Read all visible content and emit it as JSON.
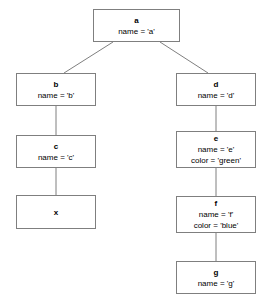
{
  "diagram": {
    "type": "tree",
    "title": "",
    "background_color": "#ffffff",
    "border_color": "#7f7f7f",
    "text_color": "#000000",
    "nodes": [
      {
        "id": "a",
        "title": "a",
        "attrs": [
          "name = 'a'"
        ],
        "x": 93,
        "y": 9,
        "w": 87,
        "h": 33
      },
      {
        "id": "b",
        "title": "b",
        "attrs": [
          "name = 'b'"
        ],
        "x": 16,
        "y": 73,
        "w": 80,
        "h": 33
      },
      {
        "id": "d",
        "title": "d",
        "attrs": [
          "name = 'd'"
        ],
        "x": 176,
        "y": 73,
        "w": 80,
        "h": 33
      },
      {
        "id": "c",
        "title": "c",
        "attrs": [
          "name = 'c'"
        ],
        "x": 16,
        "y": 135,
        "w": 80,
        "h": 33
      },
      {
        "id": "e",
        "title": "e",
        "attrs": [
          "name = 'e'",
          "color = 'green'"
        ],
        "x": 176,
        "y": 131,
        "w": 80,
        "h": 37
      },
      {
        "id": "x",
        "title": "x",
        "attrs": [],
        "x": 16,
        "y": 195,
        "w": 80,
        "h": 34
      },
      {
        "id": "f",
        "title": "f",
        "attrs": [
          "name = 'f'",
          "color = 'blue'"
        ],
        "x": 176,
        "y": 196,
        "w": 80,
        "h": 37
      },
      {
        "id": "g",
        "title": "g",
        "attrs": [
          "name = 'g'"
        ],
        "x": 176,
        "y": 261,
        "w": 80,
        "h": 33
      }
    ],
    "edges": [
      {
        "from": "a",
        "to": "b",
        "x1": 113,
        "y1": 42,
        "x2": 64,
        "y2": 73
      },
      {
        "from": "a",
        "to": "d",
        "x1": 160,
        "y1": 42,
        "x2": 208,
        "y2": 73
      },
      {
        "from": "b",
        "to": "c",
        "x1": 56,
        "y1": 106,
        "x2": 56,
        "y2": 135
      },
      {
        "from": "c",
        "to": "x",
        "x1": 56,
        "y1": 168,
        "x2": 56,
        "y2": 195
      },
      {
        "from": "d",
        "to": "e",
        "x1": 216,
        "y1": 106,
        "x2": 216,
        "y2": 131
      },
      {
        "from": "e",
        "to": "f",
        "x1": 216,
        "y1": 168,
        "x2": 216,
        "y2": 196
      },
      {
        "from": "f",
        "to": "g",
        "x1": 216,
        "y1": 233,
        "x2": 216,
        "y2": 261
      }
    ]
  }
}
